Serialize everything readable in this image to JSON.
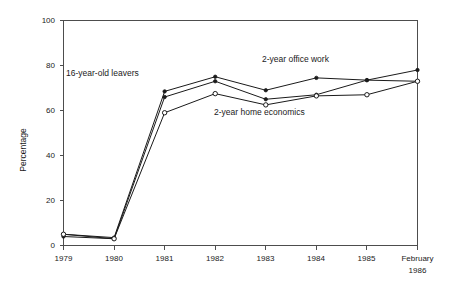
{
  "chart_data": {
    "type": "line",
    "title": "",
    "xlabel": "",
    "ylabel": "Percentage",
    "ylim": [
      0,
      100
    ],
    "yticks": [
      0,
      20,
      40,
      60,
      80,
      100
    ],
    "ytick_labels": [
      "0",
      "20",
      "40",
      "60",
      "80",
      "100"
    ],
    "categories": [
      "1979",
      "1980",
      "1981",
      "1982",
      "1983",
      "1984",
      "1985",
      "February 1986"
    ],
    "xtick_labels": [
      "1979",
      "1980",
      "1981",
      "1982",
      "1983",
      "1984",
      "1985",
      "February"
    ],
    "xtick_label_second_line": [
      "",
      "",
      "",
      "",
      "",
      "",
      "",
      "1986"
    ],
    "grid": false,
    "legend_position": "inline-annotations",
    "series": [
      {
        "name": "16-year-old leavers",
        "marker": "filled-circle",
        "values": [
          4,
          3,
          66,
          73,
          65,
          67,
          73.5,
          73
        ]
      },
      {
        "name": "2-year office work",
        "marker": "filled-circle",
        "values": [
          5,
          3.5,
          68.5,
          75,
          69,
          74.5,
          73.5,
          78
        ]
      },
      {
        "name": "2-year home economics",
        "marker": "open-circle",
        "values": [
          5,
          3,
          59,
          67.5,
          62.5,
          66.5,
          67,
          73
        ]
      }
    ],
    "annotations": [
      {
        "text": "16-year-old leavers",
        "x_px": 66,
        "y_px": 76
      },
      {
        "text": "2-year office work",
        "x_px": 262,
        "y_px": 62
      },
      {
        "text": "2-year home economics",
        "x_px": 214,
        "y_px": 112
      }
    ]
  },
  "axis": {
    "y_title": "Percentage"
  }
}
